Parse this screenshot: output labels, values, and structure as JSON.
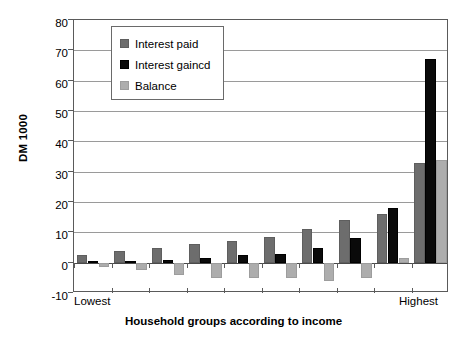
{
  "chart_data": {
    "type": "bar",
    "title": "",
    "xlabel": "Household groups according to income",
    "ylabel": "DM 1000",
    "ylim": [
      -10,
      80
    ],
    "ytick_labels": [
      "80",
      "70",
      "60",
      "50",
      "40",
      "30",
      "20",
      "10",
      "0",
      "-10"
    ],
    "ytick_values": [
      80,
      70,
      60,
      50,
      40,
      30,
      20,
      10,
      0,
      -10
    ],
    "grid": true,
    "legend_position": "upper-left-inside",
    "x_axis_end_labels": {
      "left": "Lowest",
      "right": "Highest"
    },
    "categories": [
      "1",
      "2",
      "3",
      "4",
      "5",
      "6",
      "7",
      "8",
      "9",
      "10"
    ],
    "series": [
      {
        "name": "Interest paid",
        "color": "#6d6d6d",
        "values": [
          2.5,
          4,
          5,
          6,
          7,
          8.5,
          11,
          14,
          16,
          33
        ]
      },
      {
        "name": "Interest gaincd",
        "color": "#0a0a0a",
        "values": [
          0.5,
          0.7,
          1,
          1.5,
          2.5,
          3,
          5,
          8,
          18,
          67
        ]
      },
      {
        "name": "Balance",
        "color": "#adadad",
        "values": [
          -1.5,
          -2.5,
          -4,
          -5,
          -5,
          -5,
          -6,
          -5,
          1.5,
          34
        ]
      }
    ]
  },
  "axis": {
    "y_title": "DM 1000",
    "x_title": "Household groups according to income",
    "x_left_label": "Lowest",
    "x_right_label": "Highest"
  },
  "legend": {
    "items": [
      {
        "label": "Interest paid",
        "swatch": "dark-gray-swatch-icon"
      },
      {
        "label": "Interest gaincd",
        "swatch": "black-swatch-icon"
      },
      {
        "label": "Balance",
        "swatch": "light-gray-swatch-icon"
      }
    ]
  }
}
